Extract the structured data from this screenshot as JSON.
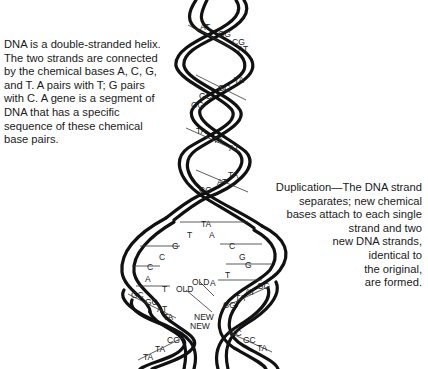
{
  "captions": {
    "left": "DNA is a double-stranded helix. The two strands are connected by the chemical bases A, C, G, and T. A pairs with T; G pairs with C. A gene is a segment of DNA that has a specific sequence of these chemical base pairs.",
    "right_lines": [
      "Duplication—The DNA strand",
      "separates; new chemical",
      "bases attach to each single",
      "strand and two",
      "new DNA strands,",
      "identical to",
      "the original,",
      "are formed."
    ]
  },
  "helix": {
    "pairs_upper": [
      {
        "label": "AT",
        "x": 200,
        "y": 28
      },
      {
        "label": "CG",
        "x": 222,
        "y": 35
      },
      {
        "label": "CG",
        "x": 236,
        "y": 43
      },
      {
        "label": "AT",
        "x": 242,
        "y": 50
      },
      {
        "label": "TA",
        "x": 238,
        "y": 81
      },
      {
        "label": "CG",
        "x": 222,
        "y": 89
      },
      {
        "label": "GC",
        "x": 203,
        "y": 97
      },
      {
        "label": "CG",
        "x": 194,
        "y": 106
      },
      {
        "label": "TA",
        "x": 200,
        "y": 132
      },
      {
        "label": "TA",
        "x": 217,
        "y": 141
      },
      {
        "label": "AT",
        "x": 233,
        "y": 149
      },
      {
        "label": "TA",
        "x": 232,
        "y": 176
      },
      {
        "label": "AT",
        "x": 221,
        "y": 183
      },
      {
        "label": "CG",
        "x": 203,
        "y": 191
      },
      {
        "label": "TA",
        "x": 205,
        "y": 225
      }
    ],
    "fork_left_bases": [
      {
        "label": "T",
        "x": 190,
        "y": 236
      },
      {
        "label": "G",
        "x": 175,
        "y": 247
      },
      {
        "label": "C",
        "x": 162,
        "y": 258
      },
      {
        "label": "C",
        "x": 150,
        "y": 268
      },
      {
        "label": "A",
        "x": 148,
        "y": 280
      },
      {
        "label": "T",
        "x": 165,
        "y": 290
      }
    ],
    "fork_right_bases": [
      {
        "label": "A",
        "x": 212,
        "y": 236
      },
      {
        "label": "C",
        "x": 232,
        "y": 247
      },
      {
        "label": "G",
        "x": 242,
        "y": 258
      },
      {
        "label": "G",
        "x": 248,
        "y": 266
      },
      {
        "label": "T",
        "x": 228,
        "y": 276
      },
      {
        "label": "A",
        "x": 213,
        "y": 284
      }
    ],
    "lower_left_pairs": [
      {
        "label": "GC",
        "x": 134,
        "y": 296
      },
      {
        "label": "GC",
        "x": 148,
        "y": 303
      },
      {
        "label": "AT",
        "x": 160,
        "y": 310
      },
      {
        "label": "TA",
        "x": 166,
        "y": 318
      },
      {
        "label": "CG",
        "x": 170,
        "y": 341
      },
      {
        "label": "TA",
        "x": 158,
        "y": 350
      },
      {
        "label": "TA",
        "x": 146,
        "y": 358
      }
    ],
    "lower_right_pairs": [
      {
        "label": "GC",
        "x": 260,
        "y": 287
      },
      {
        "label": "AT",
        "x": 248,
        "y": 293
      },
      {
        "label": "TA",
        "x": 238,
        "y": 299
      },
      {
        "label": "CG",
        "x": 226,
        "y": 306
      },
      {
        "label": "GC",
        "x": 232,
        "y": 334
      },
      {
        "label": "GC",
        "x": 246,
        "y": 341
      },
      {
        "label": "TA",
        "x": 260,
        "y": 349
      }
    ],
    "strand_tags": [
      {
        "label": "OLD",
        "x": 176,
        "y": 290
      },
      {
        "label": "OLD",
        "x": 192,
        "y": 283
      },
      {
        "label": "NEW",
        "x": 194,
        "y": 318
      },
      {
        "label": "NEW",
        "x": 190,
        "y": 327
      }
    ]
  }
}
